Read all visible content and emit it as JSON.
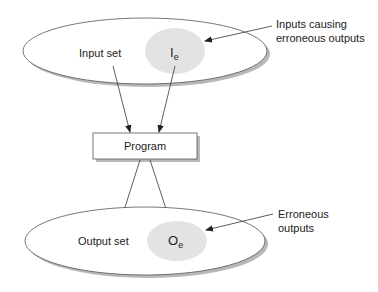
{
  "diagram": {
    "input_set": {
      "label": "Input set",
      "erroneous_subset": {
        "symbol": "I",
        "subscript": "e"
      }
    },
    "program": {
      "label": "Program"
    },
    "output_set": {
      "label": "Output set",
      "erroneous_subset": {
        "symbol": "O",
        "subscript": "e"
      }
    },
    "callouts": {
      "inputs": {
        "line1": "Inputs causing",
        "line2": "erroneous outputs"
      },
      "outputs": {
        "line1": "Erroneous",
        "line2": "outputs"
      }
    },
    "colors": {
      "stroke": "#555555",
      "shadow": "#b0b0b0",
      "subset_fill": "#e3e3e3",
      "background": "#ffffff"
    }
  }
}
